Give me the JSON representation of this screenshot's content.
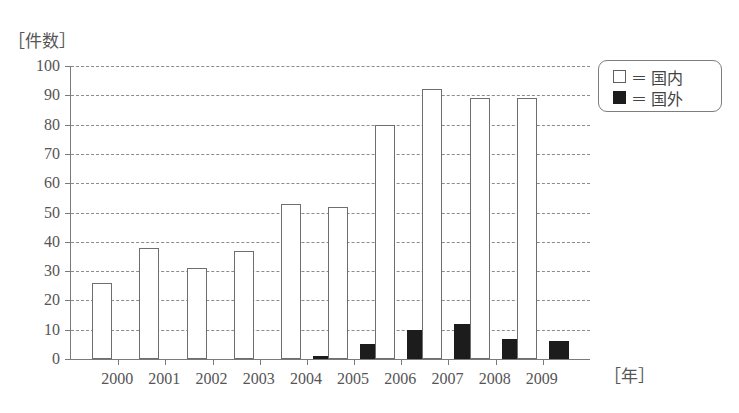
{
  "chart_data": {
    "type": "bar",
    "title": "",
    "xlabel": "年",
    "ylabel": "件数",
    "ylim": [
      0,
      100
    ],
    "ytick_step": 10,
    "yticks": [
      0,
      10,
      20,
      30,
      40,
      50,
      60,
      70,
      80,
      90,
      100
    ],
    "grid": true,
    "legend_position": "top-right",
    "categories": [
      "1999",
      "2000",
      "2001",
      "2002",
      "2003",
      "2004",
      "2005",
      "2006",
      "2007",
      "2008",
      "2009"
    ],
    "tick_labels": [
      "2000",
      "2001",
      "2002",
      "2003",
      "2004",
      "2005",
      "2006",
      "2007",
      "2008",
      "2009"
    ],
    "series": [
      {
        "name": "国内",
        "color": "#ffffff",
        "values": [
          26,
          38,
          31,
          37,
          53,
          52,
          80,
          92,
          89,
          89,
          0
        ]
      },
      {
        "name": "国外",
        "color": "#1c1c1c",
        "values": [
          0,
          0,
          0,
          0,
          1,
          5,
          10,
          12,
          7,
          6,
          0
        ]
      }
    ]
  },
  "axes": {
    "y_unit_label": "［件数］",
    "x_unit_label": "［年］"
  },
  "legend": {
    "items": [
      {
        "equals": "＝",
        "label": "国内",
        "swatch": "white-square-icon"
      },
      {
        "equals": "＝",
        "label": "国外",
        "swatch": "black-square-icon"
      }
    ]
  }
}
